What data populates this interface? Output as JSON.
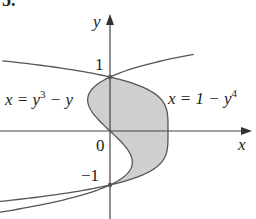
{
  "problem_number": "5.",
  "axes": {
    "x_label": "x",
    "y_label": "y",
    "origin_label": "0",
    "tick_y_pos": "1",
    "tick_y_neg": "−1"
  },
  "curves": [
    {
      "name": "left-curve",
      "label_lhs": "x = y",
      "label_exp": "3",
      "label_rhs": " − y",
      "equation": "x = y^3 - y"
    },
    {
      "name": "right-curve",
      "label_lhs": "x = 1 − y",
      "label_exp": "4",
      "label_rhs": "",
      "equation": "x = 1 - y^4"
    }
  ],
  "region": {
    "description": "shaded region between curves from y=-1 to y=1",
    "fill": "#cfcfcf"
  },
  "colors": {
    "curve": "#555555",
    "axis": "#444444",
    "shade": "#cfcfcf"
  }
}
